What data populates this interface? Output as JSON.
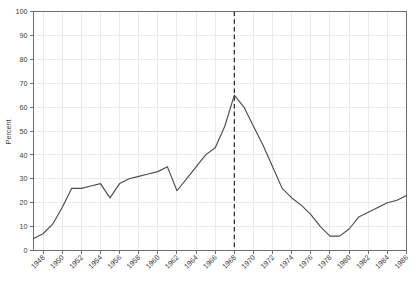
{
  "chart_data": {
    "type": "line",
    "title": "",
    "xlabel": "",
    "ylabel": "Percent",
    "xlim": [
      1947,
      1986
    ],
    "ylim": [
      0,
      100
    ],
    "grid": true,
    "legend": null,
    "y_ticks": [
      0,
      10,
      20,
      30,
      40,
      50,
      60,
      70,
      80,
      90,
      100
    ],
    "x_ticks": [
      1948,
      1950,
      1952,
      1954,
      1956,
      1958,
      1960,
      1962,
      1964,
      1966,
      1968,
      1970,
      1972,
      1974,
      1976,
      1978,
      1980,
      1982,
      1984,
      1986
    ],
    "annotations": [
      {
        "name": "reference-line",
        "type": "vertical-dashed-line",
        "x": 1968,
        "color": "#333333"
      }
    ],
    "series": [
      {
        "name": "Percent",
        "color": "#4d4d4d",
        "x": [
          1947,
          1948,
          1949,
          1950,
          1951,
          1952,
          1953,
          1954,
          1955,
          1956,
          1957,
          1958,
          1959,
          1960,
          1961,
          1962,
          1963,
          1964,
          1965,
          1966,
          1967,
          1968,
          1969,
          1970,
          1971,
          1972,
          1973,
          1974,
          1975,
          1976,
          1977,
          1978,
          1979,
          1980,
          1981,
          1982,
          1983,
          1984,
          1985,
          1986
        ],
        "values": [
          5,
          7,
          11,
          18,
          26,
          26,
          27,
          28,
          22,
          28,
          30,
          31,
          32,
          33,
          35,
          25,
          30,
          35,
          40,
          43,
          52,
          65,
          60,
          52,
          44,
          35,
          26,
          22,
          19,
          15,
          10,
          6,
          6,
          9,
          14,
          16,
          18,
          20,
          21,
          23
        ]
      }
    ]
  },
  "axes": {
    "y_label_text": "Percent"
  }
}
